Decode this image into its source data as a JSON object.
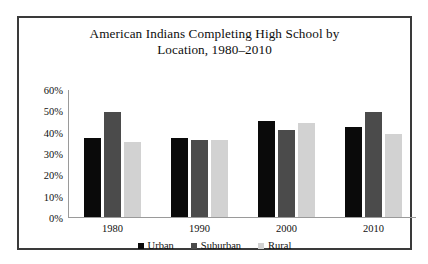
{
  "chart_data": {
    "type": "bar",
    "title": "American Indians Completing High School by Location, 1980–2010",
    "title_lines": [
      "American Indians Completing High School by",
      "Location, 1980–2010"
    ],
    "xlabel": "",
    "ylabel": "",
    "categories": [
      "1980",
      "1990",
      "2000",
      "2010"
    ],
    "series": [
      {
        "name": "Urban",
        "color": "#0a0a0a",
        "values": [
          37,
          37,
          45,
          42
        ]
      },
      {
        "name": "Suburban",
        "color": "#4b4b4b",
        "values": [
          49,
          36,
          41,
          49
        ]
      },
      {
        "name": "Rural",
        "color": "#d2d2d2",
        "values": [
          35,
          36,
          44,
          39
        ]
      }
    ],
    "ylim": [
      0,
      60
    ],
    "ytick_values": [
      0,
      10,
      20,
      30,
      40,
      50,
      60
    ],
    "ytick_labels": [
      "0%",
      "10%",
      "20%",
      "30%",
      "40%",
      "50%",
      "60%"
    ],
    "grid": false,
    "legend_position": "bottom",
    "value_suffix": "%"
  },
  "frame": {
    "border_color": "#3a3a3a",
    "background": "#ffffff"
  },
  "axis": {
    "line_color": "#9a9a9a"
  }
}
